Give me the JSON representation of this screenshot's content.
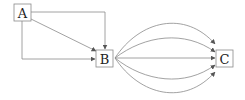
{
  "diagram": {
    "nodes": [
      {
        "id": "A",
        "label": "A",
        "x": 14,
        "y": 4,
        "w": 17,
        "h": 17
      },
      {
        "id": "B",
        "label": "B",
        "x": 96,
        "y": 50,
        "w": 17,
        "h": 17
      },
      {
        "id": "C",
        "label": "C",
        "x": 216,
        "y": 50,
        "w": 17,
        "h": 17
      }
    ],
    "edges": [
      {
        "from": "A",
        "to": "B",
        "route": "right-then-down"
      },
      {
        "from": "A",
        "to": "B",
        "route": "diagonal"
      },
      {
        "from": "A",
        "to": "B",
        "route": "down-then-right"
      },
      {
        "from": "B",
        "to": "C",
        "route": "arc-high-2"
      },
      {
        "from": "B",
        "to": "C",
        "route": "arc-high-1"
      },
      {
        "from": "B",
        "to": "C",
        "route": "straight"
      },
      {
        "from": "B",
        "to": "C",
        "route": "arc-low-1"
      },
      {
        "from": "B",
        "to": "C",
        "route": "arc-low-2"
      }
    ],
    "colors": {
      "line": "#8a8a8a",
      "box": "#8a8a8a",
      "text": "#222222"
    }
  }
}
